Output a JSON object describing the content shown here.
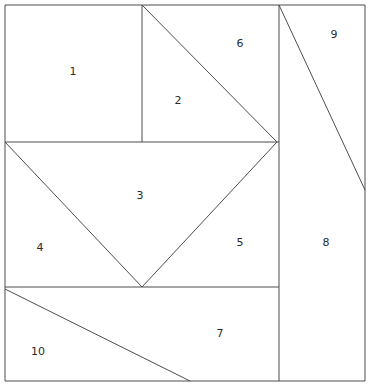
{
  "figure": {
    "type": "geometric-partition-diagram",
    "width": 370,
    "height": 390,
    "background_color": "#ffffff",
    "line_color": "#4d4d4d",
    "line_width": 1,
    "label_color": "#2b2b2b",
    "label_font_size": 11
  },
  "chart_data": {
    "type": "diagram",
    "title": "",
    "xlabel": "",
    "ylabel": "",
    "grid": false,
    "legend": "none",
    "xlim": [
      0,
      370
    ],
    "ylim": [
      0,
      390
    ],
    "vertices": {
      "outer_top_left": [
        5,
        5
      ],
      "outer_top_right": [
        365,
        5
      ],
      "outer_bottom_right": [
        365,
        381
      ],
      "outer_bottom_left": [
        5,
        381
      ],
      "top_mid_split": [
        142,
        5
      ],
      "left_mid": [
        5,
        142
      ],
      "center_right_node": [
        277,
        142
      ],
      "v_apex": [
        142,
        287
      ],
      "left_lower": [
        5,
        287
      ],
      "right_vert_top": [
        279,
        5
      ],
      "right_vert_bottom": [
        279,
        381
      ],
      "right_edge_diag_end": [
        365,
        190
      ],
      "bottom_diag_end": [
        190,
        381
      ],
      "mid_horizontal_right": [
        279,
        142
      ],
      "lower_horizontal_right": [
        279,
        287
      ]
    },
    "segments": [
      {
        "name": "outer-border-top",
        "x1": 5,
        "y1": 5,
        "x2": 365,
        "y2": 5
      },
      {
        "name": "outer-border-right",
        "x1": 365,
        "y1": 5,
        "x2": 365,
        "y2": 381
      },
      {
        "name": "outer-border-bottom",
        "x1": 365,
        "y1": 381,
        "x2": 5,
        "y2": 381
      },
      {
        "name": "outer-border-left",
        "x1": 5,
        "y1": 381,
        "x2": 5,
        "y2": 5
      },
      {
        "name": "horizontal-mid",
        "x1": 5,
        "y1": 142,
        "x2": 279,
        "y2": 142
      },
      {
        "name": "horizontal-lower",
        "x1": 5,
        "y1": 287,
        "x2": 279,
        "y2": 287
      },
      {
        "name": "vertical-region1-right",
        "x1": 142,
        "y1": 5,
        "x2": 142,
        "y2": 142
      },
      {
        "name": "vertical-right-column",
        "x1": 279,
        "y1": 5,
        "x2": 279,
        "y2": 381
      },
      {
        "name": "diagonal-region2-6",
        "x1": 142,
        "y1": 5,
        "x2": 277,
        "y2": 142
      },
      {
        "name": "diagonal-region3-4",
        "x1": 5,
        "y1": 142,
        "x2": 142,
        "y2": 287
      },
      {
        "name": "diagonal-region3-5",
        "x1": 142,
        "y1": 287,
        "x2": 277,
        "y2": 142
      },
      {
        "name": "diagonal-region9",
        "x1": 279,
        "y1": 5,
        "x2": 365,
        "y2": 190
      },
      {
        "name": "diagonal-region10-7",
        "x1": 5,
        "y1": 289,
        "x2": 190,
        "y2": 381
      }
    ],
    "regions": [
      {
        "id": 1,
        "label": "1",
        "label_x": 73,
        "label_y": 72,
        "shape": "rectangle",
        "polygon": [
          [
            5,
            5
          ],
          [
            142,
            5
          ],
          [
            142,
            142
          ],
          [
            5,
            142
          ]
        ]
      },
      {
        "id": 2,
        "label": "2",
        "label_x": 178,
        "label_y": 101,
        "shape": "triangle",
        "polygon": [
          [
            142,
            5
          ],
          [
            277,
            142
          ],
          [
            142,
            142
          ]
        ]
      },
      {
        "id": 3,
        "label": "3",
        "label_x": 140,
        "label_y": 196,
        "shape": "triangle",
        "polygon": [
          [
            5,
            142
          ],
          [
            277,
            142
          ],
          [
            142,
            287
          ]
        ]
      },
      {
        "id": 4,
        "label": "4",
        "label_x": 40,
        "label_y": 248,
        "shape": "triangle",
        "polygon": [
          [
            5,
            142
          ],
          [
            142,
            287
          ],
          [
            5,
            287
          ]
        ]
      },
      {
        "id": 5,
        "label": "5",
        "label_x": 240,
        "label_y": 243,
        "shape": "triangle",
        "polygon": [
          [
            277,
            142
          ],
          [
            279,
            287
          ],
          [
            142,
            287
          ]
        ]
      },
      {
        "id": 6,
        "label": "6",
        "label_x": 240,
        "label_y": 44,
        "shape": "triangle",
        "polygon": [
          [
            142,
            5
          ],
          [
            279,
            5
          ],
          [
            277,
            142
          ]
        ]
      },
      {
        "id": 7,
        "label": "7",
        "label_x": 220,
        "label_y": 334,
        "shape": "quadrilateral",
        "polygon": [
          [
            5,
            289
          ],
          [
            279,
            287
          ],
          [
            279,
            381
          ],
          [
            190,
            381
          ]
        ]
      },
      {
        "id": 8,
        "label": "8",
        "label_x": 326,
        "label_y": 243,
        "shape": "quadrilateral",
        "polygon": [
          [
            279,
            5
          ],
          [
            365,
            190
          ],
          [
            365,
            381
          ],
          [
            279,
            381
          ]
        ]
      },
      {
        "id": 9,
        "label": "9",
        "label_x": 334,
        "label_y": 35,
        "shape": "triangle",
        "polygon": [
          [
            279,
            5
          ],
          [
            365,
            5
          ],
          [
            365,
            190
          ]
        ]
      },
      {
        "id": 10,
        "label": "10",
        "label_x": 38,
        "label_y": 352,
        "shape": "triangle",
        "polygon": [
          [
            5,
            289
          ],
          [
            190,
            381
          ],
          [
            5,
            381
          ]
        ]
      }
    ]
  }
}
